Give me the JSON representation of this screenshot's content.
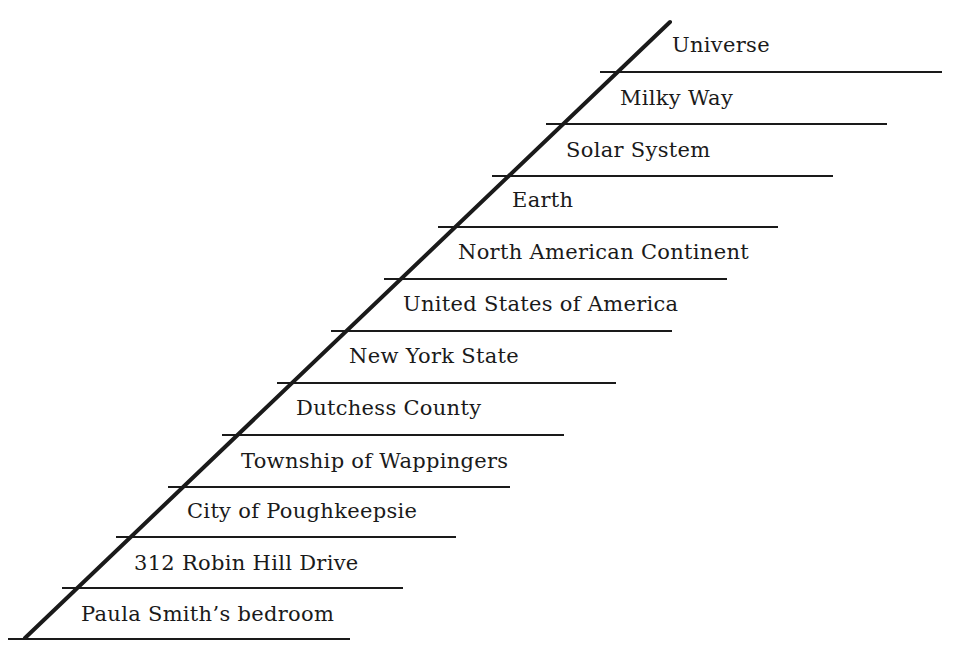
{
  "diagram": {
    "type": "nested-hierarchy-ladder",
    "line_color": "#1a1a1a",
    "diagonal": {
      "x1": 25,
      "y1": 638,
      "x2": 670,
      "y2": 22
    },
    "levels": [
      {
        "label": "Universe",
        "line_y": 72,
        "line_x1": 600,
        "line_x2": 942,
        "label_x": 672,
        "label_y": 35
      },
      {
        "label": "Milky Way",
        "line_y": 124,
        "line_x1": 546,
        "line_x2": 887,
        "label_x": 620,
        "label_y": 88
      },
      {
        "label": "Solar System",
        "line_y": 176,
        "line_x1": 492,
        "line_x2": 833,
        "label_x": 566,
        "label_y": 140
      },
      {
        "label": "Earth",
        "line_y": 227,
        "line_x1": 438,
        "line_x2": 778,
        "label_x": 512,
        "label_y": 190
      },
      {
        "label": "North American Continent",
        "line_y": 279,
        "line_x1": 384,
        "line_x2": 727,
        "label_x": 458,
        "label_y": 242
      },
      {
        "label": "United States of America",
        "line_y": 331,
        "line_x1": 331,
        "line_x2": 672,
        "label_x": 403,
        "label_y": 294
      },
      {
        "label": "New York State",
        "line_y": 383,
        "line_x1": 277,
        "line_x2": 616,
        "label_x": 349,
        "label_y": 346
      },
      {
        "label": "Dutchess County",
        "line_y": 435,
        "line_x1": 222,
        "line_x2": 564,
        "label_x": 296,
        "label_y": 398
      },
      {
        "label": "Township of Wappingers",
        "line_y": 487,
        "line_x1": 168,
        "line_x2": 510,
        "label_x": 241,
        "label_y": 451
      },
      {
        "label": "City of Poughkeepsie",
        "line_y": 537,
        "line_x1": 116,
        "line_x2": 456,
        "label_x": 187,
        "label_y": 501
      },
      {
        "label": "312 Robin Hill Drive",
        "line_y": 588,
        "line_x1": 62,
        "line_x2": 403,
        "label_x": 134,
        "label_y": 553
      },
      {
        "label": "Paula Smith’s bedroom",
        "line_y": 639,
        "line_x1": 8,
        "line_x2": 350,
        "label_x": 81,
        "label_y": 604
      }
    ]
  }
}
